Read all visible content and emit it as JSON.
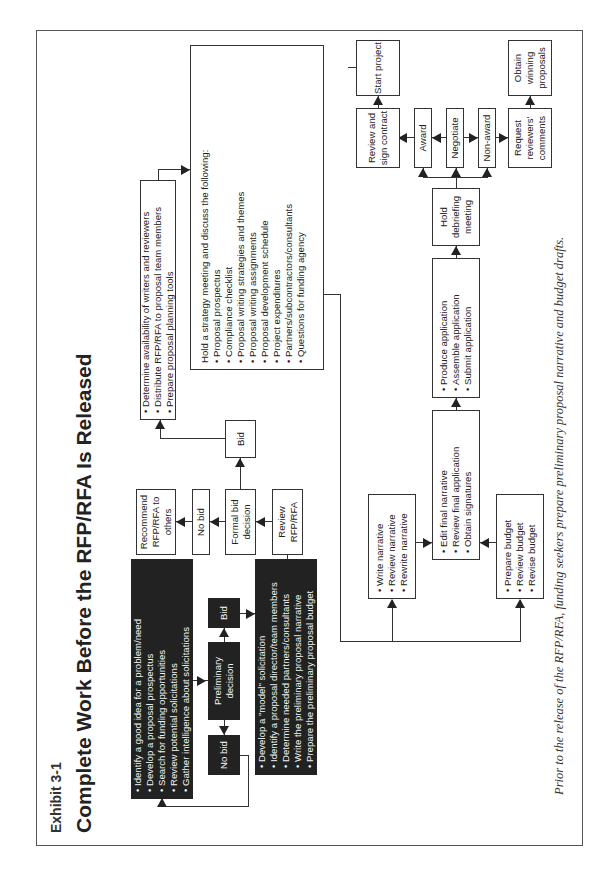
{
  "exhibit_label": "Exhibit 3-1",
  "title": "Complete Work Before the RFP/RFA Is Released",
  "caption": "Prior to the release of the RFP/RFA, funding seekers prepare preliminary proposal narrative and budget drafts.",
  "nodes": {
    "idea_box": {
      "items": [
        "Identify a good idea for a problem/need",
        "Develop a proposal prospectus",
        "Search for funding opportunities",
        "Review potential solicitations",
        "Gather intelligence about solicitations"
      ]
    },
    "prelim_no_bid": "No bid",
    "preliminary_decision": "Preliminary decision",
    "prelim_bid": "Bid",
    "model_box": {
      "items": [
        "Develop a \"model\" solicitation",
        "Identify a proposal director/team members",
        "Determine needed partners/consultants",
        "Write the preliminary proposal narrative",
        "Prepare the preliminary proposal budget"
      ]
    },
    "recommend": "Recommend RFP/RFA to others",
    "formal_no_bid": "No bid",
    "formal_bid_decision": "Formal bid decision",
    "review_rfp": "Review RFP/RFA",
    "formal_bid": "Bid",
    "planning_box": {
      "items": [
        "Determine availability of writers and reviewers",
        "Distribute RFP/RFA to proposal team members",
        "Prepare proposal planning tools"
      ]
    },
    "strategy_box": {
      "intro": "Hold a strategy meeting and discuss the following:",
      "items": [
        "Proposal prospectus",
        "Compliance checklist",
        "Proposal writing strategies and themes",
        "Proposal writing assignments",
        "Proposal development schedule",
        "Project expenditures",
        "Partners/subcontractors/consultants",
        "Questions for funding agency"
      ]
    },
    "narrative_box": {
      "items": [
        "Write narrative",
        "Review narrative",
        "Rewrite narrative"
      ]
    },
    "budget_box": {
      "items": [
        "Prepare budget",
        "Review budget",
        "Revise budget"
      ]
    },
    "final_box": {
      "items": [
        "Edit final narrative",
        "Review final application",
        "Obtain signatures"
      ]
    },
    "submit_box": {
      "items": [
        "Produce application",
        "Assemble application",
        "Submit application"
      ]
    },
    "debrief": "Hold debriefing meeting",
    "award": "Award",
    "negotiate": "Negotiate",
    "non_award": "Non-award",
    "review_contract": "Review and sign contract",
    "start_project": "Start project",
    "closeout_box": {
      "items": [
        "Reports",
        "Audit",
        "Closeout"
      ]
    },
    "request_comments": "Request reviewers' comments",
    "obtain_winning": "Obtain winning proposals",
    "resubmit": "Resubmit application"
  }
}
